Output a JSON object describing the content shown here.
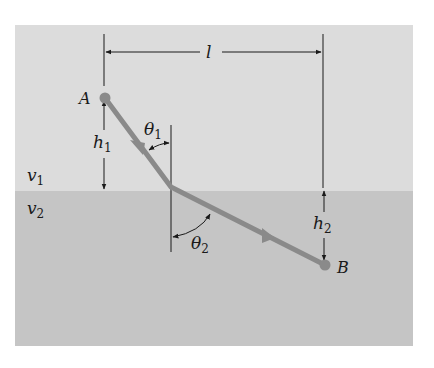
{
  "diagram": {
    "colors": {
      "background": "#ffffff",
      "medium1": "#dcdcdc",
      "medium2": "#c5c5c5",
      "ray": "#8a8a8a",
      "lines": "#1a1a1a"
    },
    "points": {
      "A": {
        "label": "A"
      },
      "B": {
        "label": "B"
      }
    },
    "media": {
      "top": {
        "symbol": "v",
        "subscript": "1"
      },
      "bottom": {
        "symbol": "v",
        "subscript": "2"
      }
    },
    "dimensions": {
      "horizontal": {
        "label": "l"
      },
      "h1": {
        "symbol": "h",
        "subscript": "1"
      },
      "h2": {
        "symbol": "h",
        "subscript": "2"
      }
    },
    "angles": {
      "theta1": {
        "symbol": "θ",
        "subscript": "1"
      },
      "theta2": {
        "symbol": "θ",
        "subscript": "2"
      }
    }
  }
}
